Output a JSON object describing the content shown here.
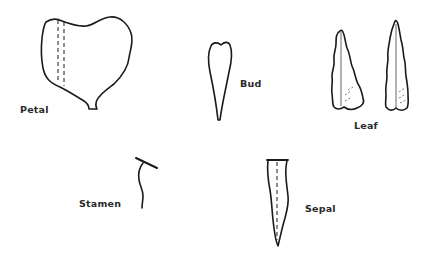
{
  "diagram": {
    "type": "botanical-parts-illustration",
    "parts": [
      {
        "id": "petal",
        "label": "Petal"
      },
      {
        "id": "bud",
        "label": "Bud"
      },
      {
        "id": "leaf",
        "label": "Leaf"
      },
      {
        "id": "stamen",
        "label": "Stamen"
      },
      {
        "id": "sepal",
        "label": "Sepal"
      }
    ],
    "colors": {
      "background": "#ffffff",
      "stroke": "#1a1a1a",
      "text": "#2a2a2a"
    }
  }
}
